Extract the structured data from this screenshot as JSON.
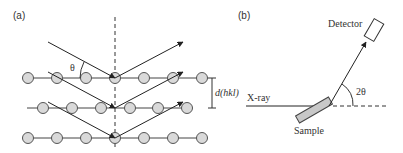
{
  "panel_a": {
    "label": "(a)",
    "theta_label": "θ",
    "spacing_label": "d(hkl)",
    "rows": [
      {
        "y": 78,
        "x": [
          28,
          57,
          86,
          115,
          144,
          173,
          202
        ]
      },
      {
        "y": 108,
        "x": [
          43,
          72,
          101,
          130,
          158,
          187
        ]
      },
      {
        "y": 138,
        "x": [
          28,
          57,
          86,
          115,
          144,
          173,
          202
        ]
      }
    ],
    "incident_rays": [
      {
        "from": [
          48,
          42
        ],
        "to": [
          115,
          78
        ]
      },
      {
        "from": [
          48,
          72
        ],
        "to": [
          115,
          108
        ]
      },
      {
        "from": [
          48,
          102
        ],
        "to": [
          115,
          138
        ]
      }
    ],
    "reflected_rays": [
      {
        "from": [
          115,
          78
        ],
        "to": [
          183,
          42
        ]
      },
      {
        "from": [
          115,
          108
        ],
        "to": [
          183,
          72
        ]
      },
      {
        "from": [
          115,
          138
        ],
        "to": [
          183,
          102
        ]
      }
    ]
  },
  "panel_b": {
    "label": "(b)",
    "detector_label": "Detector",
    "xray_label": "X-ray",
    "sample_label": "Sample",
    "angle_label": "2θ"
  },
  "colors": {
    "line": "#333333",
    "atom_fill": "#d9d9d9",
    "sample_fill": "#c8c8c8"
  }
}
